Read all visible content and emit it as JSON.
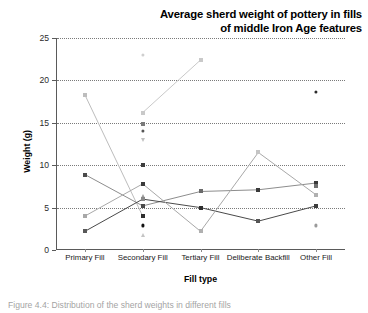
{
  "figure": {
    "caption": "Figure 4.4: Distribution of the sherd weights in different fills"
  },
  "chart_data": {
    "type": "line",
    "title": "Average sherd weight of pottery in fills\nof middle Iron Age features",
    "title_line_1": "Average sherd weight of pottery in fills",
    "title_line_2": "of middle Iron Age features",
    "xlabel": "Fill type",
    "ylabel": "Weight (g)",
    "ylim": [
      0,
      25
    ],
    "yticks": [
      0,
      5,
      10,
      15,
      20,
      25
    ],
    "ytick_labels": [
      "0",
      "5",
      "10",
      "15",
      "20",
      "25"
    ],
    "grid": "horizontal-dotted",
    "legend": "none",
    "categories": [
      "Primary Fill",
      "Secondary Fill",
      "Tertiary Fill",
      "Deliberate Backfill",
      "Other Fill"
    ],
    "series": [
      {
        "name": "series-1",
        "color": "#bdbdbd",
        "marker": "square",
        "values": [
          18.3,
          4.0,
          null,
          null,
          null
        ]
      },
      {
        "name": "series-2",
        "color": "#c9c9c9",
        "marker": "square",
        "values": [
          null,
          16.2,
          22.4,
          null,
          null
        ]
      },
      {
        "name": "series-3",
        "color": "#8d8d8d",
        "marker": "square",
        "values": [
          8.9,
          5.2,
          6.9,
          7.1,
          7.9
        ]
      },
      {
        "name": "series-4",
        "color": "#4a4a4a",
        "marker": "square",
        "values": [
          2.2,
          6.0,
          5.0,
          3.4,
          5.2
        ]
      },
      {
        "name": "series-5",
        "color": "#a8a8a8",
        "marker": "square",
        "values": [
          4.0,
          7.8,
          2.2,
          11.5,
          6.5
        ]
      },
      {
        "name": "series-6",
        "color": "#b5b5b5",
        "marker": "square",
        "values": [
          null,
          10.0,
          null,
          null,
          null
        ]
      }
    ],
    "scatter_points": [
      {
        "category": "Primary Fill",
        "value": 18.3,
        "color": "#bdbdbd",
        "marker": "square"
      },
      {
        "category": "Primary Fill",
        "value": 8.9,
        "color": "#4a4a4a",
        "marker": "square"
      },
      {
        "category": "Primary Fill",
        "value": 4.0,
        "color": "#a8a8a8",
        "marker": "square"
      },
      {
        "category": "Primary Fill",
        "value": 2.2,
        "color": "#585858",
        "marker": "square"
      },
      {
        "category": "Secondary Fill",
        "value": 23.0,
        "color": "#cfcfcf",
        "marker": "dot"
      },
      {
        "category": "Secondary Fill",
        "value": 16.2,
        "color": "#c9c9c9",
        "marker": "square"
      },
      {
        "category": "Secondary Fill",
        "value": 14.9,
        "color": "#7a7a7a",
        "marker": "square"
      },
      {
        "category": "Secondary Fill",
        "value": 14.0,
        "color": "#555555",
        "marker": "dot"
      },
      {
        "category": "Secondary Fill",
        "value": 13.0,
        "color": "#c0c0c0",
        "marker": "triangle-down"
      },
      {
        "category": "Secondary Fill",
        "value": 10.0,
        "color": "#3d3d3d",
        "marker": "square"
      },
      {
        "category": "Secondary Fill",
        "value": 7.8,
        "color": "#3a3a3a",
        "marker": "square"
      },
      {
        "category": "Secondary Fill",
        "value": 6.4,
        "color": "#9c9c9c",
        "marker": "triangle-up"
      },
      {
        "category": "Secondary Fill",
        "value": 6.0,
        "color": "#8a8a8a",
        "marker": "square"
      },
      {
        "category": "Secondary Fill",
        "value": 5.2,
        "color": "#4a4a4a",
        "marker": "square"
      },
      {
        "category": "Secondary Fill",
        "value": 4.0,
        "color": "#2e2e2e",
        "marker": "square"
      },
      {
        "category": "Secondary Fill",
        "value": 2.9,
        "color": "#111111",
        "marker": "dot"
      },
      {
        "category": "Secondary Fill",
        "value": 1.8,
        "color": "#c4c4c4",
        "marker": "triangle-up"
      },
      {
        "category": "Tertiary Fill",
        "value": 22.4,
        "color": "#c9c9c9",
        "marker": "square"
      },
      {
        "category": "Tertiary Fill",
        "value": 6.9,
        "color": "#6a6a6a",
        "marker": "square"
      },
      {
        "category": "Tertiary Fill",
        "value": 5.0,
        "color": "#2e2e2e",
        "marker": "square"
      },
      {
        "category": "Tertiary Fill",
        "value": 2.2,
        "color": "#b0b0b0",
        "marker": "square"
      },
      {
        "category": "Deliberate Backfill",
        "value": 11.5,
        "color": "#c4c4c4",
        "marker": "square"
      },
      {
        "category": "Deliberate Backfill",
        "value": 7.1,
        "color": "#3a3a3a",
        "marker": "square"
      },
      {
        "category": "Deliberate Backfill",
        "value": 3.4,
        "color": "#555555",
        "marker": "square"
      },
      {
        "category": "Other Fill",
        "value": 18.6,
        "color": "#2b2b2b",
        "marker": "dot"
      },
      {
        "category": "Other Fill",
        "value": 7.9,
        "color": "#3a3a3a",
        "marker": "square"
      },
      {
        "category": "Other Fill",
        "value": 7.6,
        "color": "#6f6f6f",
        "marker": "square"
      },
      {
        "category": "Other Fill",
        "value": 6.5,
        "color": "#b0b0b0",
        "marker": "square"
      },
      {
        "category": "Other Fill",
        "value": 5.2,
        "color": "#3d3d3d",
        "marker": "square"
      },
      {
        "category": "Other Fill",
        "value": 2.9,
        "color": "#9a9a9a",
        "marker": "dot"
      }
    ]
  }
}
